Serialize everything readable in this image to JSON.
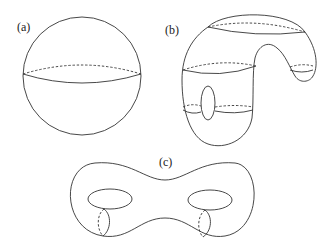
{
  "figure": {
    "panels": [
      {
        "id": "a",
        "label": "(a)",
        "description": "sphere with dashed equator"
      },
      {
        "id": "b",
        "label": "(b)",
        "description": "curved surface with handle, deformed sphere-like shape with cross-section circles"
      },
      {
        "id": "c",
        "label": "(c)",
        "description": "double torus (genus-2 surface) with two holes and dashed meridian cross-sections"
      }
    ]
  },
  "colors": {
    "stroke": "#333333",
    "background": "#ffffff",
    "text": "#222222"
  }
}
